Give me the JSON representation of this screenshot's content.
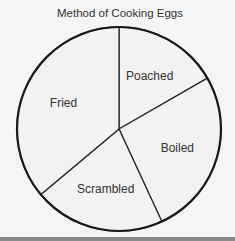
{
  "title": "Method of Cooking Eggs",
  "chart_data": {
    "type": "pie",
    "title": "Method of Cooking Eggs",
    "categories": [
      "Poached",
      "Boiled",
      "Scrambled",
      "Fried"
    ],
    "values": [
      16.7,
      26.4,
      20.8,
      36.1
    ],
    "angles_deg": [
      60,
      95,
      75,
      130
    ],
    "start_angle": "top, clockwise",
    "legend": "none (labels inside slices)"
  },
  "colors": {
    "slice_fill": "#f2f2f2",
    "outline": "#1a1a1a",
    "bottom_bar": "#8a8a8a"
  }
}
